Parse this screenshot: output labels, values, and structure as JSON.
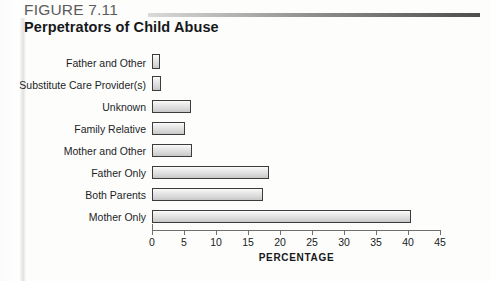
{
  "figure": {
    "label": "FIGURE 7.11",
    "title": "Perpetrators of Child Abuse",
    "rule_color": "#4e4e4e"
  },
  "chart_data": {
    "type": "bar",
    "orientation": "horizontal",
    "title": "Perpetrators of Child Abuse",
    "xlabel": "PERCENTAGE",
    "ylabel": "",
    "xlim": [
      0,
      45
    ],
    "xticks": [
      0,
      5,
      10,
      15,
      20,
      25,
      30,
      35,
      40,
      45
    ],
    "grid": false,
    "legend": null,
    "categories": [
      "Father and Other",
      "Substitute Care Provider(s)",
      "Unknown",
      "Family Relative",
      "Mother and Other",
      "Father Only",
      "Both Parents",
      "Mother Only"
    ],
    "values": [
      0.8,
      1.4,
      6.1,
      5.1,
      6.2,
      18.3,
      17.3,
      40.5
    ],
    "bar_fill": "#dcdcdd",
    "bar_outline": "#3c3c3c"
  }
}
